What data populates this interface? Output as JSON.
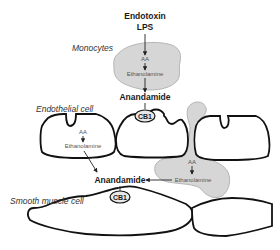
{
  "diagram": {
    "top_label": {
      "line1": "Endotoxin",
      "line2": "LPS"
    },
    "monocyte": {
      "label": "Monocytes",
      "aa": "AA",
      "ethanolamine": "Ethanolamine",
      "product": "Anandamide"
    },
    "receptor_top": "CB1",
    "endothelial": {
      "label": "Endothelial cell",
      "aa": "AA",
      "ethanolamine": "Ethanolamine"
    },
    "platelet": {
      "aa": "AA",
      "ethanolamine": "Ethanolamine"
    },
    "center_product": "Anandamide",
    "receptor_bottom": "CB1",
    "smooth_muscle": {
      "label": "Smooth muscle cell"
    },
    "colors": {
      "cell_outline": "#111111",
      "blob_fill": "#d6d6d6",
      "text": "#1a1a1a"
    }
  }
}
